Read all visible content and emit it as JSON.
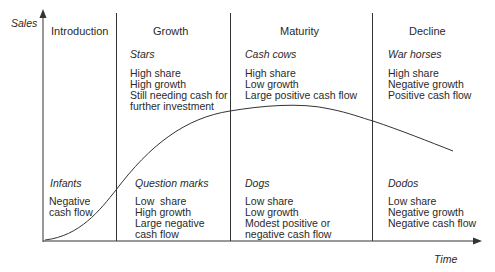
{
  "axes": {
    "y_label": "Sales",
    "x_label": "Time"
  },
  "stages": [
    {
      "name": "Introduction",
      "top": {
        "title": "",
        "lines": []
      },
      "bottom": {
        "title": "Infants",
        "lines": [
          "Negative",
          "cash flow"
        ]
      }
    },
    {
      "name": "Growth",
      "top": {
        "title": "Stars",
        "lines": [
          "High share",
          "High growth",
          "Still needing cash for",
          "further investment"
        ]
      },
      "bottom": {
        "title": "Question marks",
        "lines": [
          "Low  share",
          "High growth",
          "Large negative",
          "cash flow"
        ]
      }
    },
    {
      "name": "Maturity",
      "top": {
        "title": "Cash cows",
        "lines": [
          "High share",
          "Low growth",
          "Large positive cash flow"
        ]
      },
      "bottom": {
        "title": "Dogs",
        "lines": [
          "Low share",
          "Low growth",
          "Modest positive or",
          "negative cash flow"
        ]
      }
    },
    {
      "name": "Decline",
      "top": {
        "title": "War horses",
        "lines": [
          "High share",
          "Negative growth",
          "Positive cash flow"
        ]
      },
      "bottom": {
        "title": "Dodos",
        "lines": [
          "Low share",
          "Negative growth",
          "Negative cash flow"
        ]
      }
    }
  ],
  "colors": {
    "line": "#333333",
    "text": "#2a2a2a"
  }
}
